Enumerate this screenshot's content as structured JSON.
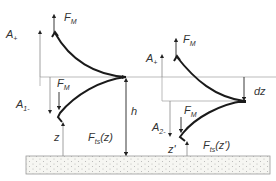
{
  "diagram": {
    "left_state": {
      "labels": {
        "force_top": "F",
        "force_top_sub": "M",
        "amp_up": "A",
        "amp_up_sub": "+",
        "force_mid": "F",
        "force_mid_sub": "M",
        "amp_down": "A",
        "amp_down_sub": "1-",
        "height": "h",
        "gap": "z",
        "ts_force": "F",
        "ts_force_sub": "ts",
        "ts_force_arg": "(z)"
      }
    },
    "right_state": {
      "labels": {
        "force_top": "F",
        "force_top_sub": "M",
        "amp_up": "A",
        "amp_up_sub": "+",
        "shift": "dz",
        "force_mid": "F",
        "force_mid_sub": "M",
        "amp_down": "A",
        "amp_down_sub": "2-",
        "gap": "z'",
        "ts_force": "F",
        "ts_force_sub": "ts",
        "ts_force_arg": "(z')"
      }
    },
    "colors": {
      "curve": "#1a1a1a",
      "line": "#888888",
      "arrow": "#222222",
      "substrate_fill": "#f4f4f0",
      "substrate_dots": "#b0b0a8"
    }
  }
}
